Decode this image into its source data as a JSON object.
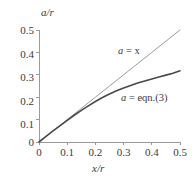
{
  "chart_data": {
    "type": "line",
    "title": "",
    "xlabel": "x/r",
    "ylabel": "a/r",
    "xlim": [
      0,
      0.5
    ],
    "ylim": [
      0,
      0.5
    ],
    "xticks": [
      "0",
      "0.1",
      "0.2",
      "0.3",
      "0.4",
      "0.5"
    ],
    "xtick_values": [
      0,
      0.1,
      0.2,
      0.3,
      0.4,
      0.5
    ],
    "yticks": [
      "0",
      "0.1",
      "0.2",
      "0.3",
      "0.4",
      "0.5"
    ],
    "ytick_values": [
      0,
      0.1,
      0.2,
      0.3,
      0.4,
      0.5
    ],
    "grid": false,
    "legend_position": "inline-annotations",
    "series": [
      {
        "name": "a = x",
        "label_text": "a = x",
        "color": "#808080",
        "line_width": 0.8,
        "x": [
          0,
          0.05,
          0.1,
          0.15,
          0.2,
          0.25,
          0.3,
          0.35,
          0.4,
          0.45,
          0.5
        ],
        "values": [
          0,
          0.05,
          0.1,
          0.15,
          0.2,
          0.25,
          0.3,
          0.35,
          0.4,
          0.45,
          0.5
        ]
      },
      {
        "name": "a = eqn.(3)",
        "label_text": "a = eqn.(3)",
        "color": "#4a4a4a",
        "line_width": 1.6,
        "x": [
          0,
          0.025,
          0.05,
          0.075,
          0.1,
          0.125,
          0.15,
          0.175,
          0.2,
          0.225,
          0.25,
          0.275,
          0.3,
          0.325,
          0.35,
          0.375,
          0.4,
          0.425,
          0.45,
          0.475,
          0.5
        ],
        "values": [
          0,
          0.025,
          0.0495,
          0.0735,
          0.097,
          0.1195,
          0.141,
          0.1615,
          0.181,
          0.1985,
          0.2145,
          0.229,
          0.2415,
          0.2525,
          0.263,
          0.2725,
          0.2815,
          0.29,
          0.2985,
          0.307,
          0.318
        ]
      }
    ],
    "annotations": [
      {
        "text": "a = x",
        "italic_part": "a",
        "rest": " = x"
      },
      {
        "text": "a = eqn.(3)",
        "italic_part": "a",
        "rest": " =  eqn.(3)"
      }
    ],
    "axis_color": "#9a9a9a",
    "background_color": "#ffffff"
  },
  "axes": {
    "y_title": "a/r",
    "x_title": "x/r",
    "x_tick_labels": [
      "0",
      "0.1",
      "0.2",
      "0.3",
      "0.4",
      "0.5"
    ],
    "y_tick_labels": [
      "0",
      "0.1",
      "0.2",
      "0.3",
      "0.4",
      "0.5"
    ]
  },
  "labels": {
    "line_straight_var": "a",
    "line_straight_rest": " = x",
    "line_curve_var": "a",
    "line_curve_rest": " =  eqn.(3)"
  }
}
